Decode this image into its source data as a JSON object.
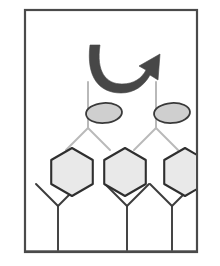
{
  "figure": {
    "title": "",
    "caption": "",
    "canvas": {
      "width": 220,
      "height": 266,
      "background": "#ffffff"
    },
    "frame": {
      "name": "panel-border",
      "x": 25,
      "y": 10,
      "width": 172,
      "height": 242,
      "stroke": "#4a4a4a",
      "stroke_width": 2.2,
      "fill": "#ffffff"
    },
    "colors": {
      "frame_stroke": "#4a4a4a",
      "arrow_fill": "#474747",
      "receptor_dark_stroke": "#3c3c3c",
      "receptor_light_stroke": "#b9b9b9",
      "hexagon_fill": "#e9e9e9",
      "hexagon_stroke": "#2f2f2f",
      "ellipse_fill": "#cfcfcf",
      "ellipse_stroke": "#3a3a3a",
      "baseline_stroke": "#5a5a5a"
    },
    "arrow": {
      "name": "rotation-arrow",
      "label": "",
      "direction": "clockwise-curved-right",
      "fill": "#474747",
      "path": "M 100 45 C 96 72 106 84 122 84 C 134 84 142 78 146 70 L 139 66 L 160 54 L 158 80 L 150 75 C 144 86 134 93 121 93 C 99 93 86 77 90 45 Z"
    },
    "baseline": {
      "name": "membrane-baseline",
      "y": 251,
      "x1": 26,
      "x2": 196,
      "stroke": "#5a5a5a",
      "stroke_width": 1.4
    },
    "upper_receptors": [
      {
        "name": "upper-receptor-left",
        "stem_x": 88,
        "stem_top": 82,
        "fork_y": 128,
        "arm_dx": 22,
        "arm_dy": 22,
        "stroke": "#b9b9b9",
        "ligand": {
          "name": "ellipse-ligand-left",
          "cx": 104,
          "cy": 113,
          "rx": 18,
          "ry": 10,
          "rotation": -4,
          "fill": "#cfcfcf",
          "stroke": "#3a3a3a"
        }
      },
      {
        "name": "upper-receptor-right",
        "stem_x": 156,
        "stem_top": 82,
        "fork_y": 128,
        "arm_dx": 22,
        "arm_dy": 22,
        "stroke": "#b9b9b9",
        "ligand": {
          "name": "ellipse-ligand-right",
          "cx": 172,
          "cy": 113,
          "rx": 18,
          "ry": 10,
          "rotation": -4,
          "fill": "#cfcfcf",
          "stroke": "#3a3a3a"
        }
      }
    ],
    "lower_receptors": [
      {
        "name": "lower-receptor-1",
        "stem_x": 58,
        "stem_bottom": 251,
        "fork_y": 206,
        "left_arm_end": {
          "x": 36,
          "y": 184
        },
        "right_arm_end": {
          "x": 80,
          "y": 184
        },
        "stroke": "#3c3c3c"
      },
      {
        "name": "lower-receptor-2",
        "stem_x": 127,
        "stem_bottom": 251,
        "fork_y": 206,
        "left_arm_end": {
          "x": 105,
          "y": 184
        },
        "right_arm_end": {
          "x": 149,
          "y": 184
        },
        "stroke": "#3c3c3c"
      },
      {
        "name": "lower-receptor-3",
        "stem_x": 172,
        "stem_bottom": 251,
        "fork_y": 206,
        "left_arm_end": {
          "x": 150,
          "y": 184
        },
        "right_arm_end": {
          "x": 194,
          "y": 184
        },
        "stroke": "#3c3c3c"
      }
    ],
    "hexagon_ligands": [
      {
        "name": "hexagon-ligand-left",
        "cx": 72,
        "cy": 172,
        "radius": 24,
        "fill": "#e9e9e9",
        "stroke": "#2f2f2f"
      },
      {
        "name": "hexagon-ligand-center",
        "cx": 125,
        "cy": 172,
        "radius": 24,
        "fill": "#e9e9e9",
        "stroke": "#2f2f2f"
      },
      {
        "name": "hexagon-ligand-right",
        "cx": 185,
        "cy": 172,
        "radius": 24,
        "fill": "#e9e9e9",
        "stroke": "#2f2f2f"
      }
    ]
  }
}
